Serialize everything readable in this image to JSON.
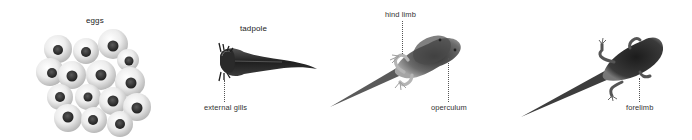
{
  "diagram": {
    "type": "frog life cycle stages",
    "stages": [
      {
        "id": "eggs",
        "title": "eggs",
        "annotations": []
      },
      {
        "id": "tadpole",
        "title": "tadpole",
        "annotations": [
          {
            "label": "external gills"
          }
        ]
      },
      {
        "id": "tadpole-hind-limbs",
        "title": "",
        "annotations": [
          {
            "label": "hind limb"
          },
          {
            "label": "operculum"
          }
        ]
      },
      {
        "id": "tadpole-forelimbs",
        "title": "",
        "annotations": [
          {
            "label": "forelimb"
          }
        ]
      }
    ],
    "colors": {
      "background": "#ffffff",
      "body_dark": "#2a2a2a",
      "body_mid": "#6e6e6e",
      "egg_jelly": "#d9d9d9",
      "egg_core": "#3a3a3a",
      "text": "#333333"
    }
  }
}
